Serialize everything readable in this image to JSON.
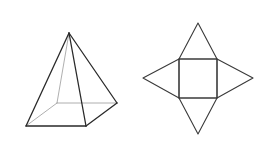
{
  "figure": {
    "width": 268,
    "height": 152,
    "background": "#ffffff",
    "colors": {
      "visible_edge": "#2a2a2a",
      "hidden_edge": "#9a9a9a",
      "net_edge": "#3a3a3a"
    }
  },
  "pyramid": {
    "label": "Square pyramid (3D view)",
    "vertices": {
      "apex": [
        69,
        33
      ],
      "front_left": [
        26,
        126
      ],
      "front_right": [
        86,
        126
      ],
      "back_right": [
        117,
        103
      ],
      "back_left": [
        57,
        103
      ]
    },
    "visible_edges": [
      [
        "apex",
        "front_left"
      ],
      [
        "apex",
        "front_right"
      ],
      [
        "apex",
        "back_right"
      ],
      [
        "front_left",
        "front_right"
      ],
      [
        "front_right",
        "back_right"
      ]
    ],
    "hidden_edges": [
      [
        "apex",
        "back_left"
      ],
      [
        "back_left",
        "front_left"
      ],
      [
        "back_left",
        "back_right"
      ]
    ]
  },
  "net": {
    "label": "Net of square pyramid",
    "square": {
      "top_left": [
        179,
        59
      ],
      "top_right": [
        217,
        59
      ],
      "bottom_right": [
        217,
        98
      ],
      "bottom_left": [
        179,
        98
      ]
    },
    "triangle_tips": {
      "top": [
        198,
        23
      ],
      "right": [
        253,
        78
      ],
      "bottom": [
        198,
        134
      ],
      "left": [
        143,
        78
      ]
    }
  }
}
